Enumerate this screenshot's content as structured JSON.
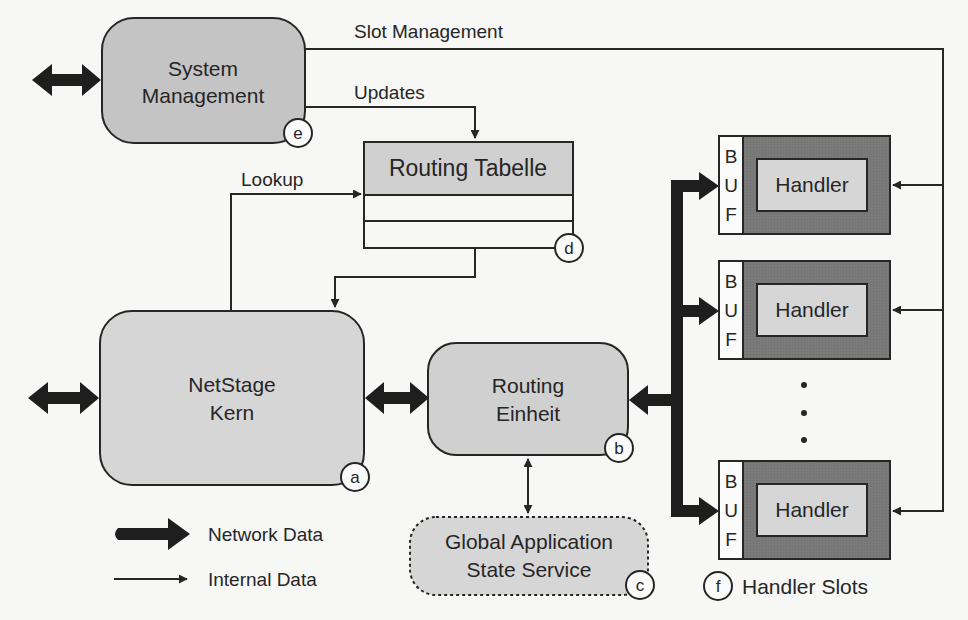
{
  "diagram": {
    "colors": {
      "background": "#f7f7f5",
      "stroke": "#262626",
      "light_fill": "#d4d4d4",
      "medium_fill": "#c4c4c4",
      "dark_fill": "#7a7a7a",
      "buf_fill": "#fbfbfb"
    },
    "nodes": {
      "system_management": {
        "line1": "System",
        "line2": "Management",
        "tag": "e"
      },
      "routing_table": {
        "title": "Routing Tabelle",
        "tag": "d"
      },
      "netstage_core": {
        "line1": "NetStage",
        "line2": "Kern",
        "tag": "a"
      },
      "routing_unit": {
        "line1": "Routing",
        "line2": "Einheit",
        "tag": "b"
      },
      "global_state": {
        "line1": "Global Application",
        "line2": "State Service",
        "tag": "c"
      },
      "handler_slots": {
        "tag": "f",
        "label": "Handler Slots",
        "slots": [
          {
            "buffer": [
              "B",
              "U",
              "F"
            ],
            "handler": "Handler"
          },
          {
            "buffer": [
              "B",
              "U",
              "F"
            ],
            "handler": "Handler"
          },
          {
            "buffer": [
              "B",
              "U",
              "F"
            ],
            "handler": "Handler"
          }
        ]
      }
    },
    "edges": {
      "slot_management": "Slot Management",
      "updates": "Updates",
      "lookup": "Lookup"
    },
    "legend": {
      "network_data": "Network Data",
      "internal_data": "Internal Data"
    }
  }
}
